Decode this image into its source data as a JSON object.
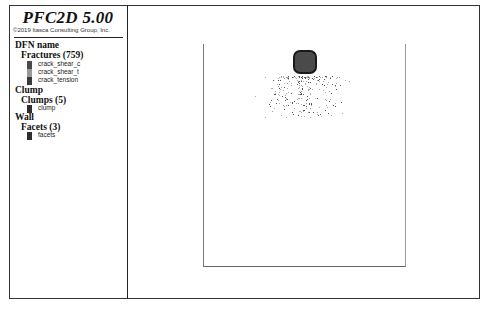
{
  "legend": {
    "title": "PFC2D 5.00",
    "copyright": "©2019 Itasca Consulting Group, Inc.",
    "groups": [
      {
        "heading": "DFN name",
        "subheading": "Fractures (759)",
        "items": [
          {
            "label": "crack_shear_c",
            "color": "#4a4a4a"
          },
          {
            "label": "crack_shear_t",
            "color": "#9a9a9a"
          },
          {
            "label": "crack_tension",
            "color": "#3a3a3a"
          }
        ]
      },
      {
        "heading": "Clump",
        "subheading": "Clumps (5)",
        "items": [
          {
            "label": "clump",
            "color": "#2e2e2e"
          }
        ]
      },
      {
        "heading": "Wall",
        "subheading": "Facets (3)",
        "items": [
          {
            "label": "facets",
            "color": "#2e2e2e"
          }
        ]
      }
    ]
  },
  "colors": {
    "frame": "#333333",
    "wall": "#777777",
    "clump_fill": "#4a4a4a",
    "clump_edge": "#1a1a1a",
    "crack": "#888888"
  }
}
